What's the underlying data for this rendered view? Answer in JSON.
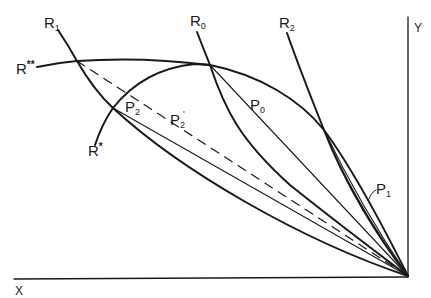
{
  "diagram": {
    "type": "geometric-construction",
    "axes": {
      "x_label": "X",
      "y_label": "Y"
    },
    "curves": [
      {
        "id": "R1",
        "base": "R",
        "sub": "1"
      },
      {
        "id": "R0",
        "base": "R",
        "sub": "0"
      },
      {
        "id": "R2",
        "base": "R",
        "sub": "2"
      },
      {
        "id": "R**",
        "base": "R",
        "sup": "**"
      },
      {
        "id": "R*",
        "base": "R",
        "sup": "*"
      }
    ],
    "points": [
      {
        "id": "P0",
        "base": "P",
        "sub": "0"
      },
      {
        "id": "P1",
        "base": "P",
        "sub": "1"
      },
      {
        "id": "P2",
        "base": "P",
        "sub": "2"
      },
      {
        "id": "P2'",
        "base": "P",
        "sub": "2",
        "prime": "'"
      }
    ],
    "labels": {
      "R1": {
        "base": "R",
        "sub": "1"
      },
      "R0": {
        "base": "R",
        "sub": "0"
      },
      "R2": {
        "base": "R",
        "sub": "2"
      },
      "Rss": {
        "base": "R",
        "sup": "**"
      },
      "Rs": {
        "base": "R",
        "sup": "*"
      },
      "P0": {
        "base": "P",
        "sub": "0"
      },
      "P1": {
        "base": "P",
        "sub": "1"
      },
      "P2": {
        "base": "P",
        "sub": "2"
      },
      "P2p": {
        "base": "P",
        "sub": "2",
        "prime": "'"
      },
      "X": "X",
      "Y": "Y"
    },
    "colors": {
      "ink": "#1a1a1a",
      "background": "#ffffff"
    }
  }
}
